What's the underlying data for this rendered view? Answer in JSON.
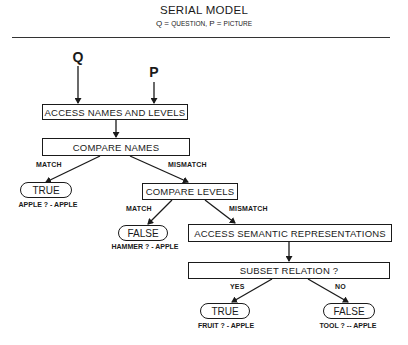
{
  "header": {
    "title": "SERIAL MODEL",
    "subtitle_q": "Q",
    "subtitle_eq1": " = ",
    "subtitle_question": "QUESTION,",
    "subtitle_p": "  P",
    "subtitle_eq2": " = ",
    "subtitle_picture": "PICTURE"
  },
  "inputs": {
    "q_label": "Q",
    "p_label": "P"
  },
  "nodes": {
    "access_names": "ACCESS NAMES AND LEVELS",
    "compare_names": "COMPARE NAMES",
    "true_1": "TRUE",
    "compare_levels": "COMPARE LEVELS",
    "false_1": "FALSE",
    "access_semantic": "ACCESS SEMANTIC REPRESENTATIONS",
    "subset_relation": "SUBSET RELATION ?",
    "true_2": "TRUE",
    "false_2": "FALSE"
  },
  "edge_labels": {
    "names_match": "MATCH",
    "names_mismatch": "MISMATCH",
    "levels_match": "MATCH",
    "levels_mismatch": "MISMATCH",
    "subset_yes": "YES",
    "subset_no": "NO"
  },
  "captions": {
    "true_1": "APPLE ? - APPLE",
    "false_1": "HAMMER ? - APPLE",
    "true_2": "FRUIT ? - APPLE",
    "false_2": "TOOL ? -- APPLE"
  },
  "colors": {
    "ink": "#1a1a1a",
    "background": "#ffffff"
  }
}
